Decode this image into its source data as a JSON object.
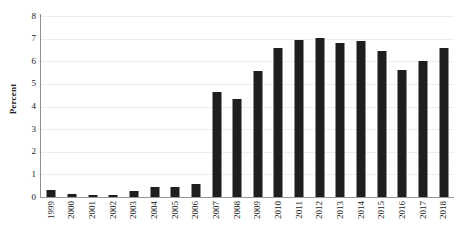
{
  "chart_data": {
    "type": "bar",
    "title": "",
    "subtitle": "",
    "xlabel": "",
    "ylabel": "Percent",
    "ylim": [
      0,
      8
    ],
    "ytick_labels": [
      "0",
      "1",
      "2",
      "3",
      "4",
      "5",
      "6",
      "7",
      "8"
    ],
    "ytick_values": [
      0,
      1,
      2,
      3,
      4,
      5,
      6,
      7,
      8
    ],
    "grid": true,
    "grid_axis": "y",
    "legend": false,
    "legend_position": "none",
    "bar_color": "#1e1e1e",
    "gridline_color": "#ededed",
    "axis_color": "#8f8f8f",
    "categories": [
      "1999",
      "2000",
      "2001",
      "2002",
      "2003",
      "2004",
      "2005",
      "2006",
      "2007",
      "2008",
      "2009",
      "2010",
      "2011",
      "2012",
      "2013",
      "2014",
      "2015",
      "2016",
      "2017",
      "2018"
    ],
    "values": [
      0.3,
      0.15,
      0.07,
      0.1,
      0.27,
      0.45,
      0.43,
      0.58,
      4.65,
      4.35,
      5.55,
      6.6,
      6.95,
      7.05,
      6.8,
      6.9,
      6.45,
      5.6,
      6.0,
      6.6
    ]
  }
}
